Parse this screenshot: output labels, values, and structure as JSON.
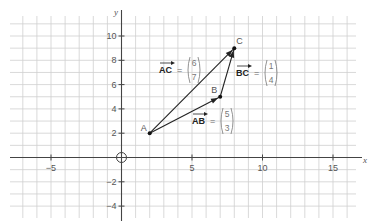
{
  "diagram": {
    "x_axis_label": "x",
    "y_axis_label": "y",
    "x_range": [
      -8,
      16
    ],
    "y_range": [
      -5,
      11
    ],
    "x_tick_labels": [
      {
        "value": -5,
        "label": "−5"
      },
      {
        "value": 5,
        "label": "5"
      },
      {
        "value": 10,
        "label": "10"
      },
      {
        "value": 15,
        "label": "15"
      }
    ],
    "y_tick_labels": [
      {
        "value": 10,
        "label": "10"
      },
      {
        "value": 8,
        "label": "8"
      },
      {
        "value": 6,
        "label": "6"
      },
      {
        "value": 4,
        "label": "4"
      },
      {
        "value": 2,
        "label": "2"
      },
      {
        "value": -2,
        "label": "−2"
      },
      {
        "value": -4,
        "label": "−4"
      }
    ],
    "origin_marker": "circle",
    "points": [
      {
        "name": "A",
        "x": 2,
        "y": 2
      },
      {
        "name": "B",
        "x": 7,
        "y": 5
      },
      {
        "name": "C",
        "x": 8,
        "y": 9
      }
    ],
    "vectors": [
      {
        "name": "AB",
        "from": "A",
        "to": "B",
        "label": "AB",
        "equals": "=",
        "components": [
          "5",
          "3"
        ]
      },
      {
        "name": "BC",
        "from": "B",
        "to": "C",
        "label": "BC",
        "equals": "=",
        "components": [
          "1",
          "4"
        ]
      },
      {
        "name": "AC",
        "from": "A",
        "to": "C",
        "label": "AC",
        "equals": "=",
        "components": [
          "6",
          "7"
        ]
      }
    ]
  }
}
